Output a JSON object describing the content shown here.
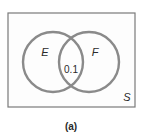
{
  "diagram": {
    "type": "venn",
    "universe_label": "S",
    "sets": [
      {
        "label": "E"
      },
      {
        "label": "F"
      }
    ],
    "intersection_value": "0.1",
    "caption": "(a)",
    "colors": {
      "circle_stroke": "#8a8a8a",
      "rect_stroke": "#7a7a7a",
      "rect_fill": "#fdfdfd",
      "text": "#2a2a2a"
    }
  }
}
